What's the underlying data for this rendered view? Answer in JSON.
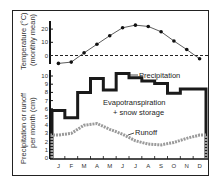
{
  "chart_data": [
    {
      "type": "line",
      "title": "",
      "ylabel": "Temperature (°C) (monthly mean)",
      "ylabel_line1": "Temperature (°C)",
      "ylabel_line2": "(monthly mean)",
      "xlabel": "",
      "categories": [
        "J",
        "F",
        "M",
        "A",
        "M",
        "J",
        "J",
        "A",
        "S",
        "O",
        "N",
        "D"
      ],
      "yticks": [
        "0",
        "10",
        "20"
      ],
      "ylim": [
        -8,
        25
      ],
      "reference_line": {
        "y": 0,
        "style": "dashed"
      },
      "series": [
        {
          "name": "Temperature",
          "values": [
            -6,
            -5,
            2,
            8.5,
            15,
            21,
            23,
            22,
            18,
            11,
            4.5,
            -2.5
          ]
        }
      ],
      "grid": false,
      "markers": "filled-circle"
    },
    {
      "type": "line",
      "title": "",
      "ylabel": "Precipitation or runoff per month (cm)",
      "ylabel_line1": "Precipitation or runoff",
      "ylabel_line2": "per month (cm)",
      "xlabel": "",
      "categories": [
        "J",
        "F",
        "M",
        "A",
        "M",
        "J",
        "J",
        "A",
        "S",
        "O",
        "N",
        "D"
      ],
      "yticks": [
        "0",
        "1",
        "2",
        "3",
        "4",
        "5",
        "6",
        "7",
        "8",
        "9",
        "10"
      ],
      "ylim": [
        0,
        10.5
      ],
      "grid": false,
      "series": [
        {
          "name": "Precipitation",
          "style": "step-solid-thick",
          "values": [
            5.8,
            4.9,
            8.0,
            9.7,
            8.3,
            10.3,
            9.8,
            9.4,
            9.1,
            7.9,
            8.4,
            8.4
          ]
        },
        {
          "name": "Runoff",
          "style": "dotted-gray",
          "values": [
            2.8,
            3.0,
            4.0,
            4.2,
            3.5,
            2.9,
            2.1,
            1.7,
            1.6,
            1.9,
            2.4,
            2.8
          ]
        }
      ],
      "annotations": [
        {
          "text": "Precipitation",
          "target": "Precipitation"
        },
        {
          "text": "Evapotranspiration",
          "line2": "+ snow storage",
          "region": "between precipitation and runoff"
        },
        {
          "text": "Runoff",
          "target": "Runoff"
        }
      ]
    }
  ],
  "labels": {
    "temp_ylabel_1": "Temperature (°C)",
    "temp_ylabel_2": "(monthly mean)",
    "flow_ylabel_1": "Precipitation or runoff",
    "flow_ylabel_2": "per month (cm)",
    "precip_ann": "Precipitation",
    "et_ann_1": "Evapotranspiration",
    "et_ann_2": "+ snow storage",
    "runoff_ann": "Runoff"
  }
}
